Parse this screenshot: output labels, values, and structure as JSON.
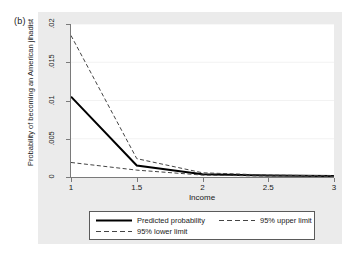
{
  "panel": {
    "label": "(b)"
  },
  "chart_data": {
    "type": "line",
    "title": "",
    "subtitle": "",
    "xlabel": "Income",
    "ylabel": "Probability of becoming an American jihadist",
    "xlim": [
      1,
      3
    ],
    "ylim": [
      0,
      0.02
    ],
    "xticks": [
      "1",
      "1.5",
      "2",
      "2.5",
      "3"
    ],
    "xtick_values": [
      1,
      1.5,
      2,
      2.5,
      3
    ],
    "yticks": [
      "0",
      ".005",
      ".01",
      ".015",
      ".02"
    ],
    "ytick_values": [
      0,
      0.005,
      0.01,
      0.015,
      0.02
    ],
    "grid": "horizontal",
    "legend_position": "below",
    "x": [
      1,
      1.5,
      2,
      2.5,
      3
    ],
    "series": [
      {
        "name": "Predicted probability",
        "style": "solid",
        "color": "#000000",
        "values": [
          0.0105,
          0.0015,
          0.00035,
          0.00018,
          0.00012
        ]
      },
      {
        "name": "95% upper limit",
        "style": "dashed",
        "color": "#444444",
        "values": [
          0.0185,
          0.0024,
          0.00055,
          0.00025,
          0.00016
        ]
      },
      {
        "name": "95% lower limit",
        "style": "dashed",
        "color": "#444444",
        "values": [
          0.0019,
          0.0009,
          0.00025,
          0.00012,
          8e-05
        ]
      }
    ]
  },
  "legend": {
    "predicted_label": "Predicted probability",
    "upper_label": "95% upper limit",
    "lower_label": "95% lower limit"
  },
  "colors": {
    "panel_background": "#ebebeb",
    "plot_background": "#ffffff",
    "axis": "#7a7a7a",
    "gridline": "#f2f2f2",
    "line_solid": "#000000",
    "line_dashed": "#444444"
  }
}
